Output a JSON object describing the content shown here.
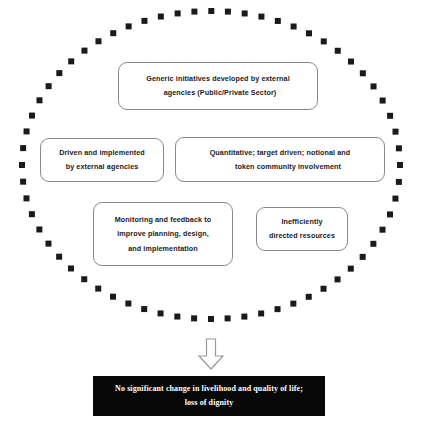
{
  "diagram": {
    "type": "concept-diagram",
    "background_color": "#ffffff",
    "boundary": {
      "shape": "ellipse",
      "style": "square-dotted",
      "color": "#1a1a1a",
      "center_x": 211,
      "center_y": 165,
      "radius_x": 189,
      "radius_y": 154,
      "dot_count": 64,
      "dot_size": 6
    },
    "boxes": [
      {
        "id": "generic-initiatives",
        "line1": "Generic initiatives developed by external",
        "line2": "agencies (Public/Private Sector)",
        "border_color": "#8a8a8a",
        "fill_color": "#ffffff"
      },
      {
        "id": "driven-implemented",
        "line1": "Driven and implemented",
        "line2": "by external agencies",
        "border_color": "#8a8a8a",
        "fill_color": "#ffffff"
      },
      {
        "id": "quantitative-target",
        "line1": "Quantitative; target driven; notional and",
        "line2": "token community involvement",
        "border_color": "#8a8a8a",
        "fill_color": "#ffffff"
      },
      {
        "id": "monitoring-feedback",
        "line1": "Monitoring and feedback to",
        "line2": "improve planning, design,",
        "line3": "and implementation",
        "border_color": "#8a8a8a",
        "fill_color": "#ffffff"
      },
      {
        "id": "inefficiently-directed",
        "line1": "Inefficiently",
        "line2": "directed resources",
        "border_color": "#8a8a8a",
        "fill_color": "#ffffff"
      }
    ],
    "connector": {
      "id": "down-arrow",
      "shape": "block-arrow-down",
      "fill_color": "#ffffff",
      "stroke_color": "#9a9a9a"
    },
    "outcome": {
      "line1": "No significant change in livelihood and quality of life;",
      "line2": "loss of dignity",
      "background_color": "#070707",
      "text_color": "#ffffff"
    }
  }
}
